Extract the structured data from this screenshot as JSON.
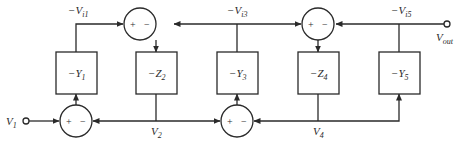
{
  "diagram": {
    "type": "ladder-filter-signal-flow-graph",
    "colors": {
      "stroke": "#2a2a2a",
      "background": "#ffffff"
    },
    "signals": {
      "top": [
        {
          "id": "vi1",
          "prefix": "−V",
          "sub": "i1"
        },
        {
          "id": "vi3",
          "prefix": "−V",
          "sub": "i3"
        },
        {
          "id": "vi5",
          "prefix": "−V",
          "sub": "i5"
        }
      ],
      "bottom": [
        {
          "id": "v2",
          "prefix": "V",
          "sub": "2"
        },
        {
          "id": "v4",
          "prefix": "V",
          "sub": "4"
        }
      ],
      "input": {
        "prefix": "V",
        "sub": "1"
      },
      "output": {
        "prefix": "V",
        "sub": "out"
      }
    },
    "blocks": [
      {
        "id": "y1",
        "prefix": "−Y",
        "sub": "1"
      },
      {
        "id": "z2",
        "prefix": "−Z",
        "sub": "2"
      },
      {
        "id": "y3",
        "prefix": "−Y",
        "sub": "3"
      },
      {
        "id": "z4",
        "prefix": "−Z",
        "sub": "4"
      },
      {
        "id": "y5",
        "prefix": "−Y",
        "sub": "5"
      }
    ],
    "summers": [
      {
        "id": "sum-top-1",
        "plus": "+",
        "minus": "−"
      },
      {
        "id": "sum-top-2",
        "plus": "+",
        "minus": "−"
      },
      {
        "id": "sum-bot-1",
        "plus": "+",
        "minus": "−"
      },
      {
        "id": "sum-bot-2",
        "plus": "+",
        "minus": "−"
      }
    ]
  }
}
